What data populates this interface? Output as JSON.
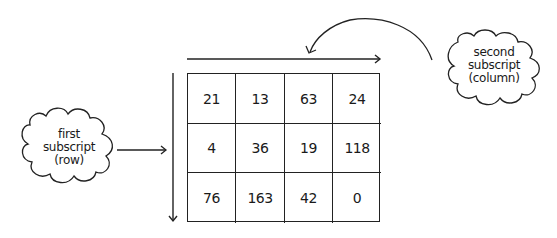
{
  "diagram": {
    "type": "2d-array-subscripts",
    "matrix": {
      "rows": [
        [
          "21",
          "13",
          "63",
          "24"
        ],
        [
          "4",
          "36",
          "19",
          "118"
        ],
        [
          "76",
          "163",
          "42",
          "0"
        ]
      ]
    },
    "annotations": {
      "row_label": {
        "line1": "first",
        "line2": "subscript",
        "line3": "(row)"
      },
      "column_label": {
        "line1": "second",
        "line2": "subscript",
        "line3": "(column)"
      }
    }
  }
}
